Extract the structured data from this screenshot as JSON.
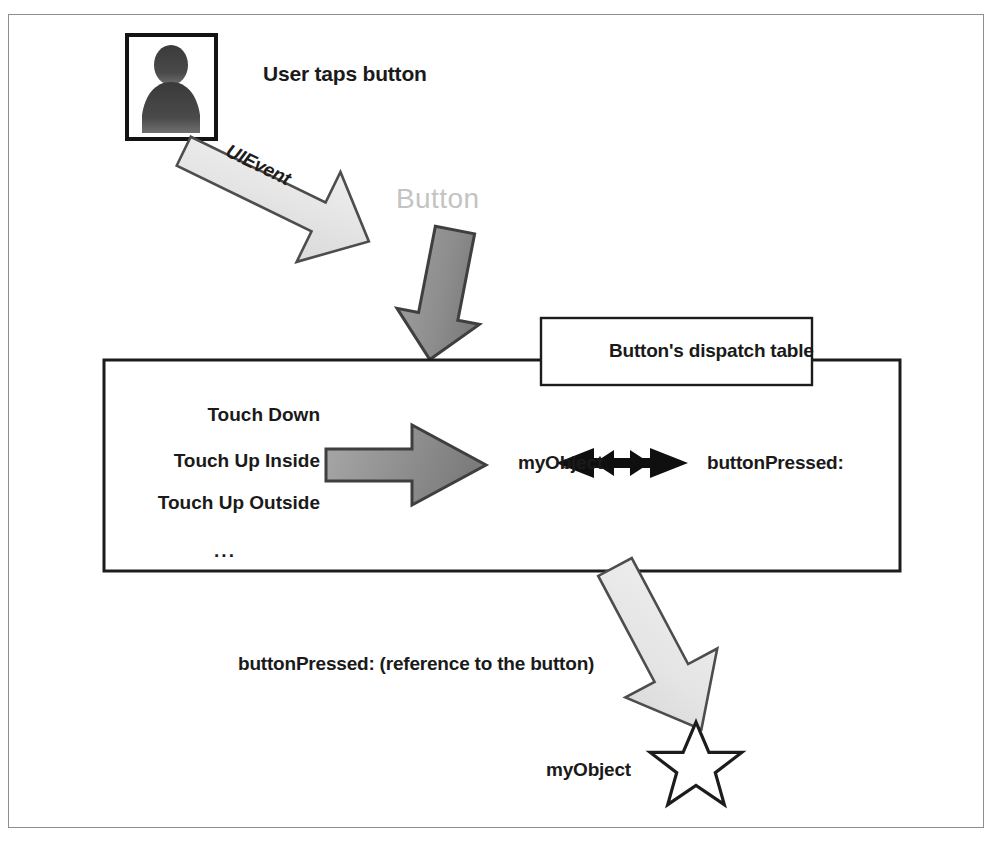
{
  "figure": {
    "frame_color": "#8e8e8e",
    "background": "#ffffff"
  },
  "actors": {
    "user_icon_name": "user-silhouette-icon",
    "user_caption": "User taps button"
  },
  "flow": {
    "event_arrow_label": "UIEvent",
    "button_ghost_label": "Button",
    "callback_label": "buttonPressed: (reference to the button)",
    "receiver_label": "myObject"
  },
  "dispatch_table": {
    "title": "Button's dispatch table",
    "events": [
      "Touch Down",
      "Touch Up Inside",
      "Touch Up Outside"
    ],
    "ellipsis": "...",
    "target": "myObject",
    "action": "buttonPressed:",
    "link_icon_name": "double-headed-arrow-icon"
  },
  "colors": {
    "ink": "#1a1a1a",
    "ghost_text": "#c3c3c3",
    "light_arrow_fill": "#e8e8e8",
    "light_arrow_stroke": "#4a4a4a",
    "dark_arrow_fill": "#8f8f8f",
    "dark_arrow_stroke": "#3d3d3d",
    "box_stroke": "#1c1c1c",
    "frame_stroke": "#8e8e8e"
  }
}
